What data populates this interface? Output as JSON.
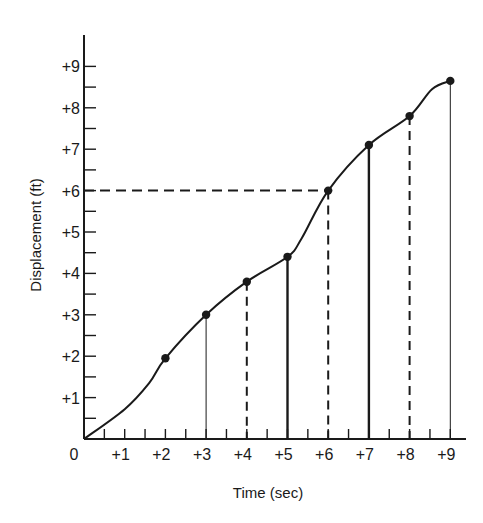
{
  "chart_data": {
    "type": "line",
    "title": "",
    "xlabel": "Time (sec)",
    "ylabel": "Displacement (ft)",
    "xlim": [
      0,
      9.8
    ],
    "ylim": [
      0,
      9.7
    ],
    "grid": false,
    "legend": null,
    "x_tick_labels": [
      "0",
      "+1",
      "+2",
      "+3",
      "+4",
      "+5",
      "+6",
      "+7",
      "+8",
      "+9"
    ],
    "y_tick_labels": [
      "+1",
      "+2",
      "+3",
      "+4",
      "+5",
      "+6",
      "+7",
      "+8",
      "+9"
    ],
    "origin_label": "0",
    "series": [
      {
        "name": "Displacement",
        "x": [
          0,
          2,
          3,
          4,
          5,
          6,
          7,
          8,
          9
        ],
        "values": [
          0,
          1.95,
          3.0,
          3.8,
          4.4,
          6.0,
          7.1,
          7.8,
          8.65
        ],
        "markers_at": [
          2,
          3,
          4,
          5,
          6,
          7,
          8,
          9
        ],
        "smooth": true
      }
    ],
    "drop_lines": [
      {
        "x": 3,
        "y": 3.0,
        "style": "solid-thin"
      },
      {
        "x": 4,
        "y": 3.8,
        "style": "dashed"
      },
      {
        "x": 5,
        "y": 4.4,
        "style": "solid-thick"
      },
      {
        "x": 6,
        "y": 6.0,
        "style": "dashed"
      },
      {
        "x": 7,
        "y": 7.1,
        "style": "solid-thick"
      },
      {
        "x": 8,
        "y": 7.8,
        "style": "dashed"
      },
      {
        "x": 9,
        "y": 8.65,
        "style": "solid-thin"
      }
    ],
    "annotations": [
      {
        "type": "horizontal-dashed-line",
        "y": 6.0,
        "from_x": 0,
        "to_x": 6
      }
    ]
  },
  "style": {
    "ink": "#1a1a1a",
    "background": "#ffffff"
  }
}
